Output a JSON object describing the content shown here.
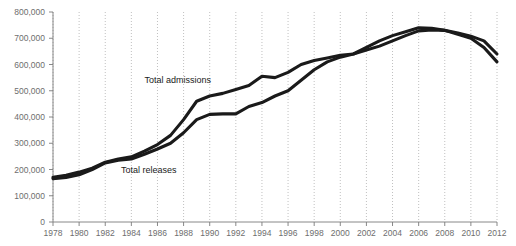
{
  "chart_data": {
    "type": "line",
    "title": "",
    "subtitle": "",
    "xlabel": "",
    "ylabel": "",
    "xlim": [
      1978,
      2012
    ],
    "ylim": [
      0,
      800000
    ],
    "grid": "vertical-dotted",
    "legend_position": "inline-annotations",
    "x": [
      1978,
      1979,
      1980,
      1981,
      1982,
      1983,
      1984,
      1985,
      1986,
      1987,
      1988,
      1989,
      1990,
      1991,
      1992,
      1993,
      1994,
      1995,
      1996,
      1997,
      1998,
      1999,
      2000,
      2001,
      2002,
      2003,
      2004,
      2005,
      2006,
      2007,
      2008,
      2009,
      2010,
      2011,
      2012
    ],
    "xticks": [
      "1978",
      "1980",
      "1982",
      "1984",
      "1986",
      "1988",
      "1990",
      "1992",
      "1994",
      "1996",
      "1998",
      "2000",
      "2002",
      "2004",
      "2006",
      "2008",
      "2010",
      "2012"
    ],
    "xtick_values": [
      1978,
      1980,
      1982,
      1984,
      1986,
      1988,
      1990,
      1992,
      1994,
      1996,
      1998,
      2000,
      2002,
      2004,
      2006,
      2008,
      2010,
      2012
    ],
    "yticks": [
      "0",
      "100,000",
      "200,000",
      "300,000",
      "400,000",
      "500,000",
      "600,000",
      "700,000",
      "800,000"
    ],
    "ytick_values": [
      0,
      100000,
      200000,
      300000,
      400000,
      500000,
      600000,
      700000,
      800000
    ],
    "series": [
      {
        "name": "Total admissions",
        "label": "Total admissions",
        "color": "#1a1a1a",
        "label_x": 1985.0,
        "label_y": 530000,
        "values": [
          170000,
          178000,
          190000,
          205000,
          228000,
          240000,
          248000,
          270000,
          295000,
          330000,
          390000,
          460000,
          480000,
          490000,
          505000,
          520000,
          555000,
          550000,
          570000,
          600000,
          615000,
          625000,
          635000,
          640000,
          665000,
          690000,
          710000,
          725000,
          740000,
          738000,
          730000,
          715000,
          700000,
          665000,
          610000
        ]
      },
      {
        "name": "Total releases",
        "label": "Total releases",
        "color": "#1a1a1a",
        "label_x": 1983.2,
        "label_y": 185000,
        "values": [
          165000,
          170000,
          180000,
          200000,
          225000,
          235000,
          240000,
          258000,
          278000,
          300000,
          340000,
          390000,
          410000,
          412000,
          412000,
          440000,
          455000,
          480000,
          500000,
          540000,
          580000,
          610000,
          628000,
          640000,
          655000,
          670000,
          690000,
          710000,
          728000,
          732000,
          730000,
          720000,
          708000,
          690000,
          640000
        ]
      }
    ]
  }
}
